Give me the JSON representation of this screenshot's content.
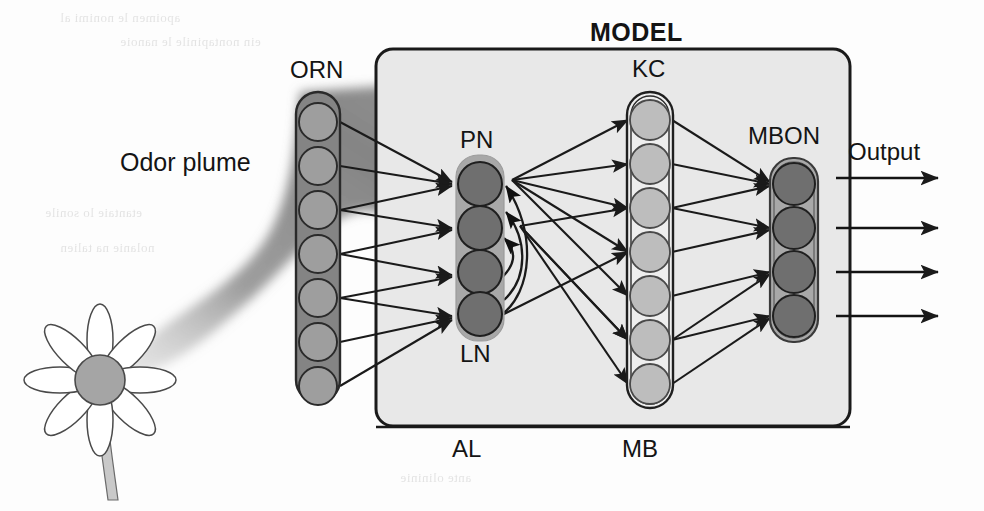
{
  "figure": {
    "title": "MODEL",
    "background_color": "#fdfdfd",
    "box": {
      "fill": "#e8e8e8",
      "stroke": "#1a1a1a"
    }
  },
  "labels": {
    "model": "MODEL",
    "odor_plume": "Odor plume",
    "orn": "ORN",
    "pn": "PN",
    "ln": "LN",
    "kc": "KC",
    "mbon": "MBON",
    "output": "Output",
    "al": "AL",
    "mb": "MB"
  },
  "layers": [
    {
      "id": "orn",
      "label": "ORN",
      "label_position": "top",
      "neuron_count": 7,
      "capsule_fill": "#848484",
      "capsule_stroke": "#2a2a2a",
      "neuron_fill": "#9e9e9e",
      "neuron_stroke": "#2a2a2a"
    },
    {
      "id": "al",
      "label_top": "PN",
      "label_bottom": "LN",
      "neuron_count": 4,
      "capsule_fill": "#a8a8a8",
      "capsule_stroke": "#a8a8a8",
      "neuron_fill": "#6f6f6f",
      "neuron_stroke": "#1f1f1f"
    },
    {
      "id": "kc",
      "label": "KC",
      "label_position": "top",
      "neuron_count": 7,
      "capsule_fill": "#eeeeee",
      "capsule_stroke": "#1f1f1f",
      "neuron_fill": "#bdbdbd",
      "neuron_stroke": "#4a4a4a"
    },
    {
      "id": "mbon",
      "label": "MBON",
      "label_position": "top",
      "neuron_count": 4,
      "capsule_fill": "#a8a8a8",
      "capsule_stroke": "#3a3a3a",
      "neuron_fill": "#6f6f6f",
      "neuron_stroke": "#1f1f1f"
    }
  ],
  "regions": [
    {
      "id": "al",
      "label": "AL"
    },
    {
      "id": "mb",
      "label": "MB"
    }
  ],
  "stimulus": {
    "flower_petals": 8,
    "flower_center_color": "#a5a5a5",
    "stem_color": "#c9c9c9",
    "plume_color": "#8f8f8f",
    "plume_label": "Odor plume"
  },
  "outputs": {
    "label": "Output",
    "arrow_count": 4
  },
  "connections": {
    "orn_to_pn": 7,
    "pn_to_kc": 9,
    "ln_recurrent": 4,
    "kc_to_mbon": 9,
    "mbon_lateral": 2
  },
  "bleed_text": [
    "apoimen le nonimi al",
    "ein nontapinile le nanoie",
    "etantaie lo sonile",
    "nolanie na talien",
    "ante noi litantie",
    "omiselantie po",
    "ante olininie"
  ]
}
